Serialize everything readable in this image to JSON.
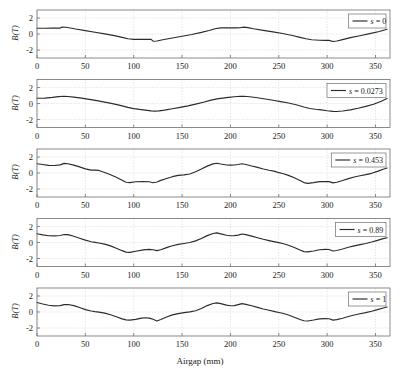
{
  "figure": {
    "width": 400,
    "height": 374,
    "background": "#ffffff",
    "line_color": "#2b2b2b",
    "grid_color": "#cfcfcf",
    "axis_color": "#6e6e6e",
    "text_color": "#1a1a1a"
  },
  "chart_data": {
    "type": "line",
    "title": "",
    "xlabel": "Airgap (mm)",
    "ylabel": "B(T)",
    "xlim": [
      0,
      365
    ],
    "ylim": [
      -3,
      3
    ],
    "xticks": [
      0,
      50,
      100,
      150,
      200,
      250,
      300,
      350
    ],
    "xticklabels": [
      "0",
      "50",
      "100",
      "150",
      "200",
      "250",
      "300",
      "350"
    ],
    "yticks": [
      -2,
      0,
      2
    ],
    "yticklabels": [
      "-2",
      "0",
      "2"
    ],
    "grid": true,
    "legend_position": "upper right",
    "shared_x": true,
    "n_subplots": 5,
    "subplots": [
      {
        "index": 0,
        "legend": "s = 0",
        "legend_symbol": "s",
        "legend_value": "0",
        "ylabel": "B(T)",
        "x": [
          0,
          8,
          16,
          24,
          26,
          30,
          40,
          50,
          60,
          70,
          80,
          88,
          94,
          100,
          108,
          114,
          118,
          120,
          124,
          130,
          140,
          150,
          160,
          170,
          178,
          184,
          190,
          196,
          200,
          206,
          210,
          214,
          218,
          224,
          234,
          244,
          254,
          264,
          272,
          278,
          284,
          292,
          298,
          302,
          306,
          310,
          316,
          324,
          334,
          344,
          354,
          362
        ],
        "y": [
          0.72,
          0.72,
          0.73,
          0.74,
          0.86,
          0.85,
          0.62,
          0.42,
          0.22,
          0.02,
          -0.2,
          -0.42,
          -0.6,
          -0.68,
          -0.68,
          -0.68,
          -0.68,
          -0.9,
          -0.88,
          -0.72,
          -0.5,
          -0.28,
          -0.06,
          0.2,
          0.44,
          0.66,
          0.76,
          0.76,
          0.76,
          0.76,
          0.78,
          0.86,
          0.8,
          0.66,
          0.46,
          0.26,
          0.06,
          -0.18,
          -0.42,
          -0.6,
          -0.72,
          -0.78,
          -0.8,
          -0.8,
          -0.94,
          -0.88,
          -0.7,
          -0.46,
          -0.22,
          0.04,
          0.32,
          0.6
        ]
      },
      {
        "index": 1,
        "legend": "s = 0.0273",
        "legend_symbol": "s",
        "legend_value": "0.0273",
        "ylabel": "B(T)",
        "x": [
          0,
          8,
          16,
          22,
          28,
          32,
          38,
          46,
          54,
          62,
          70,
          78,
          86,
          94,
          100,
          106,
          112,
          118,
          122,
          126,
          132,
          140,
          148,
          156,
          164,
          172,
          180,
          186,
          192,
          198,
          204,
          210,
          214,
          220,
          228,
          236,
          244,
          252,
          260,
          268,
          276,
          282,
          288,
          294,
          300,
          306,
          310,
          316,
          324,
          332,
          340,
          348,
          356,
          362
        ],
        "y": [
          0.66,
          0.68,
          0.76,
          0.86,
          0.9,
          0.88,
          0.8,
          0.68,
          0.52,
          0.36,
          0.18,
          -0.02,
          -0.24,
          -0.48,
          -0.64,
          -0.74,
          -0.82,
          -0.92,
          -0.96,
          -0.92,
          -0.82,
          -0.66,
          -0.48,
          -0.3,
          -0.08,
          0.16,
          0.42,
          0.58,
          0.68,
          0.76,
          0.84,
          0.9,
          0.9,
          0.84,
          0.72,
          0.56,
          0.4,
          0.24,
          0.06,
          -0.16,
          -0.44,
          -0.62,
          -0.72,
          -0.8,
          -0.9,
          -0.98,
          -1.0,
          -0.94,
          -0.8,
          -0.6,
          -0.36,
          -0.1,
          0.28,
          0.62
        ]
      },
      {
        "index": 2,
        "legend": "s = 0.453",
        "legend_symbol": "s",
        "legend_value": "0.453",
        "ylabel": "B(T)",
        "x": [
          0,
          6,
          12,
          18,
          24,
          28,
          32,
          38,
          44,
          50,
          56,
          60,
          64,
          70,
          76,
          82,
          88,
          92,
          96,
          102,
          110,
          116,
          120,
          124,
          128,
          134,
          140,
          146,
          152,
          158,
          164,
          170,
          176,
          182,
          186,
          190,
          196,
          200,
          204,
          208,
          212,
          216,
          222,
          228,
          234,
          240,
          246,
          250,
          254,
          260,
          266,
          272,
          276,
          280,
          286,
          292,
          298,
          302,
          306,
          310,
          316,
          322,
          328,
          334,
          340,
          346,
          352,
          358,
          362
        ],
        "y": [
          1.16,
          1.06,
          0.96,
          0.94,
          1.02,
          1.2,
          1.16,
          0.98,
          0.76,
          0.52,
          0.36,
          0.36,
          0.32,
          0.06,
          -0.22,
          -0.54,
          -0.9,
          -1.16,
          -1.2,
          -1.1,
          -1.08,
          -1.1,
          -1.22,
          -1.12,
          -0.92,
          -0.68,
          -0.46,
          -0.3,
          -0.24,
          -0.12,
          0.16,
          0.5,
          0.86,
          1.14,
          1.22,
          1.12,
          1.0,
          0.98,
          1.0,
          1.06,
          1.16,
          1.06,
          0.88,
          0.7,
          0.5,
          0.34,
          0.2,
          0.04,
          -0.06,
          -0.3,
          -0.6,
          -0.94,
          -1.2,
          -1.3,
          -1.2,
          -1.08,
          -1.06,
          -1.08,
          -1.24,
          -1.16,
          -0.94,
          -0.7,
          -0.5,
          -0.34,
          -0.2,
          -0.04,
          0.2,
          0.46,
          0.62
        ]
      },
      {
        "index": 3,
        "legend": "s = 0.89",
        "legend_symbol": "s",
        "legend_value": "0.89",
        "ylabel": "B(T)",
        "x": [
          0,
          6,
          12,
          18,
          24,
          28,
          32,
          38,
          44,
          50,
          56,
          60,
          64,
          70,
          76,
          82,
          88,
          92,
          96,
          102,
          110,
          116,
          120,
          124,
          128,
          134,
          140,
          146,
          152,
          158,
          164,
          170,
          176,
          182,
          186,
          190,
          196,
          200,
          204,
          208,
          212,
          216,
          222,
          228,
          234,
          240,
          246,
          250,
          254,
          260,
          266,
          272,
          276,
          280,
          286,
          292,
          298,
          302,
          306,
          310,
          316,
          322,
          328,
          334,
          340,
          346,
          352,
          358,
          362
        ],
        "y": [
          1.1,
          0.96,
          0.84,
          0.82,
          0.88,
          1.0,
          0.98,
          0.78,
          0.54,
          0.3,
          0.1,
          0.02,
          -0.06,
          -0.2,
          -0.42,
          -0.72,
          -1.02,
          -1.2,
          -1.24,
          -1.1,
          -0.92,
          -0.86,
          -0.9,
          -1.02,
          -0.9,
          -0.64,
          -0.4,
          -0.24,
          -0.12,
          0.0,
          0.2,
          0.5,
          0.86,
          1.12,
          1.2,
          1.08,
          0.9,
          0.84,
          0.86,
          0.92,
          1.06,
          0.98,
          0.8,
          0.6,
          0.4,
          0.24,
          0.08,
          -0.02,
          -0.12,
          -0.34,
          -0.62,
          -0.94,
          -1.14,
          -1.18,
          -1.06,
          -0.9,
          -0.86,
          -0.88,
          -1.06,
          -1.0,
          -0.82,
          -0.6,
          -0.42,
          -0.26,
          -0.12,
          0.06,
          0.26,
          0.48,
          0.6
        ]
      },
      {
        "index": 4,
        "legend": "s = 1",
        "legend_symbol": "s",
        "legend_value": "1",
        "ylabel": "B(T)",
        "x": [
          0,
          6,
          12,
          18,
          24,
          28,
          32,
          38,
          44,
          50,
          56,
          60,
          64,
          70,
          76,
          82,
          88,
          92,
          96,
          102,
          108,
          112,
          116,
          120,
          124,
          128,
          134,
          140,
          146,
          152,
          158,
          164,
          170,
          176,
          182,
          186,
          190,
          196,
          200,
          204,
          208,
          212,
          216,
          222,
          228,
          234,
          240,
          246,
          250,
          254,
          260,
          266,
          272,
          276,
          280,
          286,
          292,
          298,
          302,
          306,
          310,
          316,
          322,
          328,
          334,
          340,
          346,
          352,
          358,
          362
        ],
        "y": [
          1.18,
          1.0,
          0.84,
          0.76,
          0.8,
          0.92,
          0.94,
          0.8,
          0.56,
          0.3,
          0.12,
          0.04,
          -0.02,
          -0.14,
          -0.34,
          -0.6,
          -0.86,
          -0.98,
          -1.02,
          -0.92,
          -0.76,
          -0.72,
          -0.76,
          -0.9,
          -1.12,
          -0.94,
          -0.62,
          -0.36,
          -0.2,
          -0.08,
          0.02,
          0.16,
          0.44,
          0.8,
          1.06,
          1.14,
          1.04,
          0.86,
          0.78,
          0.8,
          0.92,
          1.04,
          0.96,
          0.78,
          0.58,
          0.38,
          0.22,
          0.04,
          -0.06,
          -0.16,
          -0.38,
          -0.66,
          -0.94,
          -1.1,
          -1.12,
          -1.0,
          -0.86,
          -0.82,
          -0.84,
          -1.02,
          -0.96,
          -0.78,
          -0.56,
          -0.38,
          -0.22,
          -0.08,
          0.1,
          0.3,
          0.5,
          0.62
        ]
      }
    ]
  }
}
